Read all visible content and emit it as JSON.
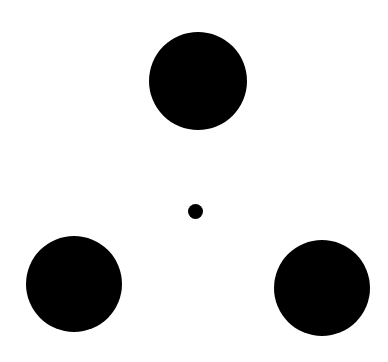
{
  "canvas": {
    "width": 388,
    "height": 362,
    "background": "#ffffff"
  },
  "figure": {
    "fill_color": "#000000",
    "circles": [
      {
        "id": "top",
        "cx": 198,
        "cy": 81,
        "r": 49
      },
      {
        "id": "bottom-left",
        "cx": 74,
        "cy": 284,
        "r": 48
      },
      {
        "id": "bottom-right",
        "cx": 322,
        "cy": 288,
        "r": 48
      }
    ],
    "center_dot": {
      "cx": 195,
      "cy": 211,
      "r": 7.5
    }
  }
}
